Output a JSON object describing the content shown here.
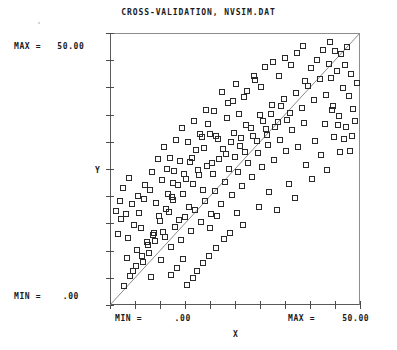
{
  "chart": {
    "title": "CROSS-VALIDATION, NVSIM.DAT",
    "x_axis_title": "X",
    "y_axis_title": "Y",
    "y_max_label": "MAX =   50.00",
    "y_min_label": "MIN =    .00",
    "x_min_label": "MIN =      .00",
    "x_max_label": "MAX =     50.00",
    "marker_color": "#2a2a2a",
    "line_color": "#8a8a8a",
    "frame_color": "#5a5a5a",
    "background": "#ffffff"
  },
  "chart_data": {
    "type": "scatter",
    "title": "CROSS-VALIDATION, NVSIM.DAT",
    "xlabel": "X",
    "ylabel": "Y",
    "xlim": [
      0,
      50
    ],
    "ylim": [
      0,
      50
    ],
    "grid": false,
    "legend": null,
    "x_ticks": [
      0,
      5,
      10,
      15,
      20,
      25,
      30,
      35,
      40,
      45,
      50
    ],
    "y_ticks": [
      0,
      5,
      10,
      15,
      20,
      25,
      30,
      35,
      40,
      45,
      50
    ],
    "x_tick_labels": [
      "MIN = .00",
      "",
      "",
      "",
      "",
      "",
      "",
      "",
      "MAX =",
      "",
      "50.00"
    ],
    "y_tick_labels": [
      "MIN = .00",
      "",
      "",
      "",
      "",
      "",
      "",
      "",
      "",
      "",
      "MAX = 50.00"
    ],
    "annotations": [
      {
        "text": "MAX =   50.00",
        "position": "outside-top-left"
      },
      {
        "text": "MIN =    .00",
        "position": "outside-bottom-left"
      },
      {
        "text": "MIN =      .00",
        "position": "outside-bottom-axis-left"
      },
      {
        "text": "MAX =     50.00",
        "position": "outside-bottom-axis-right"
      }
    ],
    "reference_line": {
      "type": "identity",
      "from": [
        0,
        0
      ],
      "to": [
        50,
        50
      ],
      "style": "thin-solid"
    },
    "marker": {
      "shape": "open-square",
      "size_px": 7
    },
    "n_points": 208,
    "points": [
      [
        20.0,
        31.4
      ],
      [
        21.3,
        31.0
      ],
      [
        23.4,
        34.2
      ],
      [
        24.6,
        37.4
      ],
      [
        25.9,
        35.0
      ],
      [
        27.5,
        39.2
      ],
      [
        29.1,
        41.2
      ],
      [
        30.3,
        40.0
      ],
      [
        31.0,
        43.6
      ],
      [
        32.6,
        44.6
      ],
      [
        33.8,
        42.0
      ],
      [
        35.0,
        45.4
      ],
      [
        36.2,
        44.0
      ],
      [
        37.4,
        46.2
      ],
      [
        38.6,
        47.6
      ],
      [
        39.0,
        41.0
      ],
      [
        40.2,
        43.4
      ],
      [
        41.4,
        45.0
      ],
      [
        42.6,
        46.8
      ],
      [
        43.8,
        44.2
      ],
      [
        44.2,
        41.6
      ],
      [
        45.4,
        43.0
      ],
      [
        46.6,
        39.8
      ],
      [
        47.8,
        38.4
      ],
      [
        48.6,
        36.0
      ],
      [
        6.2,
        14.0
      ],
      [
        7.4,
        11.4
      ],
      [
        8.6,
        12.8
      ],
      [
        9.8,
        16.2
      ],
      [
        10.6,
        13.4
      ],
      [
        11.8,
        17.0
      ],
      [
        12.6,
        19.2
      ],
      [
        13.8,
        15.6
      ],
      [
        14.6,
        20.4
      ],
      [
        15.8,
        18.0
      ],
      [
        16.6,
        22.2
      ],
      [
        17.8,
        23.8
      ],
      [
        18.6,
        21.0
      ],
      [
        19.4,
        25.4
      ],
      [
        20.6,
        24.0
      ],
      [
        21.8,
        26.8
      ],
      [
        22.6,
        28.6
      ],
      [
        23.8,
        25.0
      ],
      [
        24.2,
        29.8
      ],
      [
        25.0,
        27.2
      ],
      [
        26.2,
        30.6
      ],
      [
        27.0,
        28.0
      ],
      [
        28.2,
        32.4
      ],
      [
        29.4,
        30.0
      ],
      [
        30.6,
        33.8
      ],
      [
        31.4,
        31.2
      ],
      [
        32.2,
        35.0
      ],
      [
        33.0,
        32.6
      ],
      [
        34.2,
        36.4
      ],
      [
        35.4,
        34.0
      ],
      [
        3.4,
        8.6
      ],
      [
        4.6,
        6.2
      ],
      [
        5.4,
        10.0
      ],
      [
        6.6,
        7.8
      ],
      [
        7.8,
        9.4
      ],
      [
        8.2,
        5.0
      ],
      [
        9.0,
        11.6
      ],
      [
        10.2,
        8.2
      ],
      [
        11.0,
        12.4
      ],
      [
        12.2,
        10.6
      ],
      [
        13.0,
        14.2
      ],
      [
        14.2,
        11.8
      ],
      [
        15.0,
        16.0
      ],
      [
        16.2,
        13.6
      ],
      [
        17.0,
        17.4
      ],
      [
        18.2,
        15.2
      ],
      [
        19.0,
        19.0
      ],
      [
        20.2,
        16.6
      ],
      [
        21.0,
        20.8
      ],
      [
        22.2,
        18.4
      ],
      [
        23.0,
        22.6
      ],
      [
        24.4,
        20.2
      ],
      [
        25.6,
        24.4
      ],
      [
        26.4,
        21.8
      ],
      [
        27.6,
        26.0
      ],
      [
        28.4,
        23.4
      ],
      [
        29.6,
        27.8
      ],
      [
        30.4,
        25.2
      ],
      [
        31.6,
        29.4
      ],
      [
        32.8,
        26.6
      ],
      [
        34.0,
        30.2
      ],
      [
        35.2,
        28.2
      ],
      [
        36.4,
        32.0
      ],
      [
        37.6,
        29.0
      ],
      [
        38.8,
        33.4
      ],
      [
        22.4,
        39.0
      ],
      [
        23.6,
        37.0
      ],
      [
        25.2,
        40.6
      ],
      [
        26.8,
        38.2
      ],
      [
        28.8,
        42.0
      ],
      [
        20.8,
        35.6
      ],
      [
        19.6,
        33.2
      ],
      [
        18.4,
        30.8
      ],
      [
        17.2,
        28.4
      ],
      [
        16.0,
        26.2
      ],
      [
        14.8,
        24.0
      ],
      [
        13.6,
        22.0
      ],
      [
        12.4,
        19.8
      ],
      [
        11.2,
        17.6
      ],
      [
        10.0,
        15.4
      ],
      [
        8.8,
        13.2
      ],
      [
        7.6,
        11.0
      ],
      [
        6.4,
        9.0
      ],
      [
        5.2,
        7.0
      ],
      [
        4.0,
        5.2
      ],
      [
        2.8,
        3.4
      ],
      [
        3.6,
        12.2
      ],
      [
        4.8,
        14.6
      ],
      [
        2.2,
        15.8
      ],
      [
        1.6,
        13.0
      ],
      [
        5.8,
        16.8
      ],
      [
        6.8,
        19.4
      ],
      [
        8.0,
        21.0
      ],
      [
        9.2,
        18.6
      ],
      [
        10.4,
        22.8
      ],
      [
        11.6,
        20.4
      ],
      [
        12.8,
        24.6
      ],
      [
        14.0,
        26.4
      ],
      [
        15.2,
        23.0
      ],
      [
        16.4,
        27.0
      ],
      [
        17.6,
        24.8
      ],
      [
        18.8,
        28.8
      ],
      [
        20.4,
        26.0
      ],
      [
        21.6,
        30.4
      ],
      [
        23.2,
        27.6
      ],
      [
        24.8,
        31.6
      ],
      [
        26.0,
        29.2
      ],
      [
        27.2,
        33.0
      ],
      [
        28.6,
        31.0
      ],
      [
        30.0,
        34.8
      ],
      [
        31.2,
        32.2
      ],
      [
        32.4,
        36.6
      ],
      [
        33.6,
        33.6
      ],
      [
        34.8,
        37.8
      ],
      [
        36.0,
        35.2
      ],
      [
        37.2,
        38.8
      ],
      [
        38.4,
        36.2
      ],
      [
        39.6,
        40.2
      ],
      [
        40.8,
        37.6
      ],
      [
        42.0,
        41.4
      ],
      [
        43.2,
        38.6
      ],
      [
        44.4,
        35.8
      ],
      [
        45.6,
        33.0
      ],
      [
        46.8,
        30.4
      ],
      [
        48.0,
        28.2
      ],
      [
        41.0,
        30.0
      ],
      [
        42.2,
        27.4
      ],
      [
        43.4,
        24.8
      ],
      [
        39.2,
        25.6
      ],
      [
        40.4,
        23.0
      ],
      [
        8.4,
        24.4
      ],
      [
        9.6,
        26.8
      ],
      [
        10.8,
        29.0
      ],
      [
        12.0,
        27.0
      ],
      [
        13.2,
        30.2
      ],
      [
        14.4,
        32.4
      ],
      [
        15.6,
        29.8
      ],
      [
        16.8,
        33.8
      ],
      [
        18.0,
        31.4
      ],
      [
        19.2,
        35.8
      ],
      [
        11.4,
        25.0
      ],
      [
        12.6,
        22.4
      ],
      [
        7.0,
        22.0
      ],
      [
        5.6,
        20.0
      ],
      [
        4.4,
        18.4
      ],
      [
        3.2,
        16.6
      ],
      [
        2.0,
        19.0
      ],
      [
        1.2,
        17.2
      ],
      [
        2.6,
        21.4
      ],
      [
        3.8,
        23.2
      ],
      [
        25.4,
        16.8
      ],
      [
        26.6,
        14.6
      ],
      [
        24.0,
        13.2
      ],
      [
        22.8,
        12.0
      ],
      [
        21.2,
        10.4
      ],
      [
        19.8,
        9.0
      ],
      [
        18.6,
        7.6
      ],
      [
        17.4,
        6.2
      ],
      [
        16.6,
        4.8
      ],
      [
        15.4,
        3.6
      ],
      [
        14.6,
        8.4
      ],
      [
        13.4,
        6.8
      ],
      [
        12.2,
        5.4
      ],
      [
        20.0,
        14.0
      ],
      [
        21.4,
        16.2
      ],
      [
        29.8,
        18.0
      ],
      [
        31.8,
        20.6
      ],
      [
        33.4,
        17.4
      ],
      [
        35.8,
        22.2
      ],
      [
        37.0,
        19.6
      ],
      [
        44.8,
        30.8
      ],
      [
        46.0,
        28.0
      ],
      [
        47.2,
        32.6
      ],
      [
        48.4,
        31.0
      ],
      [
        49.0,
        33.8
      ],
      [
        43.0,
        33.2
      ],
      [
        44.6,
        36.4
      ],
      [
        45.8,
        34.6
      ],
      [
        47.0,
        44.0
      ],
      [
        48.2,
        42.4
      ],
      [
        49.4,
        40.8
      ],
      [
        46.2,
        46.0
      ],
      [
        47.4,
        47.4
      ],
      [
        44.0,
        48.2
      ],
      [
        45.0,
        46.6
      ]
    ]
  }
}
